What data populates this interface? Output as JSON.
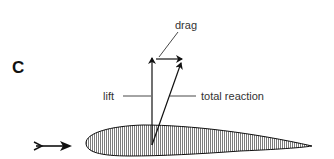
{
  "diagram": {
    "panel_label": "C",
    "labels": {
      "drag": "drag",
      "lift": "lift",
      "total_reaction": "total reaction"
    },
    "elements": [
      {
        "id": "airfoil",
        "type": "shape",
        "description": "hatched airfoil cross-section"
      },
      {
        "id": "airflow-arrow",
        "type": "arrow",
        "direction": "right"
      },
      {
        "id": "lift-vector",
        "type": "arrow",
        "direction": "up",
        "label": "lift"
      },
      {
        "id": "drag-vector",
        "type": "arrow",
        "direction": "right",
        "label": "drag"
      },
      {
        "id": "total-reaction-vector",
        "type": "arrow",
        "direction": "up-right",
        "label": "total reaction"
      }
    ],
    "colors": {
      "ink": "#111111",
      "text": "#333333",
      "background": "#ffffff"
    }
  }
}
